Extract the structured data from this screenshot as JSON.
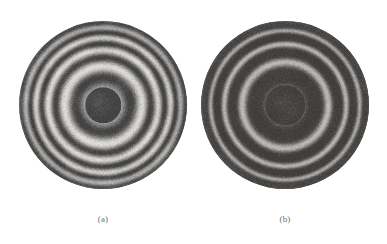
{
  "figure": {
    "background_color": "#ffffff",
    "width": 387,
    "height": 244,
    "caption_color": "#6f6f70",
    "panels": [
      {
        "id": "panel-a",
        "label": "(a)",
        "label_x": 103,
        "label_y": 214,
        "center_x": 103,
        "center_y": 105,
        "radius": 84,
        "description": "High-contrast concentric circular interference fringes with dark central spot",
        "contrast": "high",
        "ring_count": 16,
        "center_tone": "dark",
        "center_spot_radius": 18,
        "bright_color": "#f2f0ec",
        "dark_color": "#3b3a3a",
        "base_color": "#6c6a68",
        "noise_amount": 0.3,
        "ring_spacing_mode": "fresnel",
        "first_ring_period": 19,
        "ring_sharpness": 1.0,
        "vignette": 0.22,
        "mottle": 0.22,
        "seed": 1701
      },
      {
        "id": "panel-b",
        "label": "(b)",
        "label_x": 285,
        "label_y": 214,
        "center_x": 285,
        "center_y": 105,
        "radius": 84,
        "description": "Low-contrast concentric circular interference fringes, predominantly dark field with thin bright rings",
        "contrast": "low",
        "ring_count": 21,
        "center_tone": "dark",
        "center_spot_radius": 20,
        "bright_color": "#cfcdc8",
        "dark_color": "#3a3938",
        "base_color": "#4b4a49",
        "noise_amount": 0.34,
        "ring_spacing_mode": "fresnel",
        "first_ring_period": 21,
        "ring_sharpness": 2.6,
        "vignette": 0.14,
        "mottle": 0.12,
        "seed": 9043
      }
    ]
  },
  "chart_data": {
    "type": "image-pair",
    "title": "",
    "subtitle": "",
    "xlabel": "",
    "ylabel": "",
    "legend": [],
    "annotations": [
      "(a)",
      "(b)"
    ],
    "series": [
      {
        "name": "(a)",
        "pattern": "concentric-rings",
        "center": [
          103,
          105
        ],
        "radius": 84,
        "visible_ring_count": 16,
        "center_intensity": "dark",
        "fringe_visibility": "high"
      },
      {
        "name": "(b)",
        "pattern": "concentric-rings",
        "center": [
          285,
          105
        ],
        "radius": 84,
        "visible_ring_count": 21,
        "center_intensity": "dark",
        "fringe_visibility": "low"
      }
    ]
  }
}
